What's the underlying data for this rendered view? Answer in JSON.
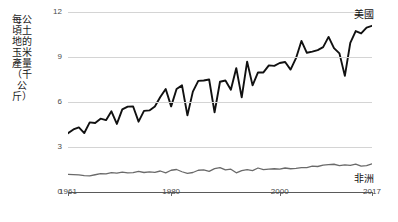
{
  "chart_data": {
    "type": "line",
    "title": "",
    "subtitle": "",
    "xlabel": "",
    "ylabel": "每公頃土地的玉米產量（千公斤）",
    "xlim": [
      1961,
      2017
    ],
    "ylim": [
      0,
      12
    ],
    "yticks": [
      "0",
      "3",
      "6",
      "9",
      "12"
    ],
    "ytick_values": [
      0,
      3,
      6,
      9,
      12
    ],
    "xticks": [
      "1961",
      "1980",
      "2000",
      "2017"
    ],
    "xtick_values": [
      1961,
      1980,
      2000,
      2017
    ],
    "grid": "horizontal",
    "legend_position": "right-inline",
    "x": [
      1961,
      1962,
      1963,
      1964,
      1965,
      1966,
      1967,
      1968,
      1969,
      1970,
      1971,
      1972,
      1973,
      1974,
      1975,
      1976,
      1977,
      1978,
      1979,
      1980,
      1981,
      1982,
      1983,
      1984,
      1985,
      1986,
      1987,
      1988,
      1989,
      1990,
      1991,
      1992,
      1993,
      1994,
      1995,
      1996,
      1997,
      1998,
      1999,
      2000,
      2001,
      2002,
      2003,
      2004,
      2005,
      2006,
      2007,
      2008,
      2009,
      2010,
      2011,
      2012,
      2013,
      2014,
      2015,
      2016,
      2017
    ],
    "series": [
      {
        "name": "美國",
        "color": "#111111",
        "label_position": "top-right",
        "values": [
          3.92,
          4.17,
          4.31,
          3.93,
          4.64,
          4.6,
          4.89,
          4.79,
          5.38,
          4.54,
          5.51,
          5.69,
          5.7,
          4.69,
          5.41,
          5.44,
          5.7,
          6.33,
          6.87,
          5.71,
          6.87,
          7.11,
          5.11,
          6.69,
          7.41,
          7.43,
          7.5,
          5.31,
          7.35,
          7.43,
          6.82,
          8.26,
          6.31,
          8.69,
          7.11,
          7.97,
          7.97,
          8.44,
          8.41,
          8.6,
          8.67,
          8.16,
          8.92,
          10.07,
          9.28,
          9.36,
          9.46,
          9.66,
          10.34,
          9.59,
          9.24,
          7.74,
          9.94,
          10.73,
          10.57,
          10.96,
          11.08
        ]
      },
      {
        "name": "非洲",
        "color": "#6a6a6a",
        "label_position": "bottom-right",
        "values": [
          1.17,
          1.16,
          1.14,
          1.09,
          1.07,
          1.15,
          1.22,
          1.21,
          1.29,
          1.26,
          1.33,
          1.27,
          1.29,
          1.38,
          1.3,
          1.34,
          1.31,
          1.4,
          1.28,
          1.45,
          1.5,
          1.35,
          1.24,
          1.3,
          1.45,
          1.47,
          1.38,
          1.56,
          1.63,
          1.47,
          1.52,
          1.28,
          1.43,
          1.49,
          1.43,
          1.6,
          1.49,
          1.53,
          1.55,
          1.52,
          1.6,
          1.55,
          1.58,
          1.62,
          1.63,
          1.72,
          1.7,
          1.79,
          1.83,
          1.85,
          1.76,
          1.81,
          1.78,
          1.86,
          1.72,
          1.76,
          1.88
        ]
      }
    ]
  },
  "axis": {
    "y_title": "每公頃土地的玉米產量（千公斤）"
  }
}
